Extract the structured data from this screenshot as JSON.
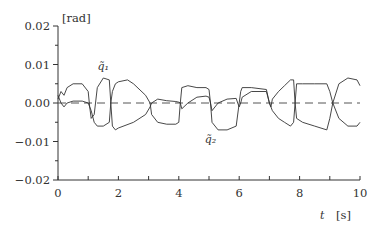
{
  "chart_data": {
    "type": "line",
    "title": "",
    "xlabel": "t",
    "xunit": "[s]",
    "ylabel": "",
    "yunit": "[rad]",
    "xlim": [
      0,
      10
    ],
    "ylim": [
      -0.02,
      0.02
    ],
    "xticks": [
      0,
      2,
      4,
      6,
      8,
      10
    ],
    "xtick_labels": [
      "0",
      "2",
      "4",
      "6",
      "8",
      "10"
    ],
    "xminor_ticks": [
      1,
      3,
      5,
      7,
      9
    ],
    "yticks": [
      -0.02,
      -0.01,
      0.0,
      0.01,
      0.02
    ],
    "ytick_labels": [
      "−0.02",
      "−0.01",
      "0.00",
      "0.01",
      "0.02"
    ],
    "yminor_ticks": [
      -0.015,
      -0.005,
      0.005,
      0.015
    ],
    "grid": false,
    "reference_line": {
      "y": 0.0,
      "style": "dashed"
    },
    "annotations": [
      {
        "text": "q̃₁",
        "label": "q1",
        "x": 1.5,
        "y": 0.0085
      },
      {
        "text": "q̃₂",
        "label": "q2",
        "x": 5.05,
        "y": -0.0103
      }
    ],
    "series": [
      {
        "name": "q1",
        "x": [
          0.0,
          0.1,
          0.2,
          0.3,
          0.5,
          0.8,
          1.0,
          1.05,
          1.1,
          1.2,
          1.3,
          1.5,
          1.7,
          1.75,
          1.8,
          1.9,
          2.0,
          2.5,
          2.9,
          3.05,
          3.1,
          3.3,
          3.6,
          3.9,
          4.0,
          4.05,
          4.1,
          4.3,
          4.6,
          4.9,
          5.0,
          5.05,
          5.1,
          5.3,
          5.6,
          5.9,
          5.95,
          6.0,
          6.05,
          6.1,
          6.4,
          6.9,
          7.0,
          7.05,
          7.1,
          7.3,
          7.5,
          7.7,
          7.8,
          7.85,
          7.9,
          8.1,
          8.5,
          8.9,
          9.0,
          9.1,
          9.3,
          9.6,
          9.9,
          10.0
        ],
        "values": [
          0.001,
          0.003,
          0.002,
          0.004,
          0.005,
          0.005,
          0.003,
          -0.001,
          -0.004,
          -0.003,
          0.004,
          0.0065,
          0.006,
          0.0,
          -0.006,
          -0.007,
          -0.0065,
          -0.005,
          -0.003,
          -0.001,
          0.0,
          0.001,
          0.0006,
          0.0004,
          0.0002,
          0.0,
          -0.0015,
          0.0,
          0.0015,
          0.0018,
          0.0015,
          0.0,
          -0.002,
          0.0,
          0.001,
          0.0012,
          0.0,
          -0.001,
          0.0,
          0.0015,
          0.003,
          0.003,
          0.0,
          -0.001,
          0.001,
          0.003,
          0.0045,
          0.006,
          0.006,
          0.0,
          -0.004,
          -0.005,
          -0.006,
          -0.007,
          -0.004,
          0.0,
          0.005,
          0.0065,
          0.006,
          0.0045
        ]
      },
      {
        "name": "q2",
        "x": [
          0.0,
          0.1,
          0.2,
          0.3,
          0.5,
          0.8,
          1.0,
          1.1,
          1.2,
          1.3,
          1.5,
          1.7,
          1.75,
          1.8,
          1.9,
          2.0,
          2.3,
          2.5,
          2.9,
          3.05,
          3.1,
          3.3,
          3.6,
          3.9,
          4.0,
          4.05,
          4.1,
          4.3,
          4.6,
          4.9,
          5.0,
          5.05,
          5.1,
          5.3,
          5.6,
          5.9,
          6.0,
          6.05,
          6.1,
          6.4,
          6.9,
          7.0,
          7.1,
          7.3,
          7.5,
          7.7,
          7.8,
          7.85,
          7.9,
          8.1,
          8.5,
          8.9,
          9.0,
          9.1,
          9.3,
          9.6,
          9.9,
          10.0
        ],
        "values": [
          0.002,
          0.0,
          -0.001,
          0.0,
          0.0005,
          0.0005,
          0.0,
          -0.002,
          -0.005,
          -0.006,
          -0.006,
          -0.005,
          0.0,
          0.003,
          0.005,
          0.0055,
          0.006,
          0.005,
          0.002,
          0.0,
          -0.003,
          -0.005,
          -0.0055,
          -0.0055,
          -0.005,
          0.0,
          0.004,
          0.0045,
          0.004,
          0.004,
          0.0035,
          0.0,
          -0.005,
          -0.007,
          -0.007,
          -0.006,
          0.0,
          0.003,
          0.004,
          0.004,
          0.0035,
          0.0,
          -0.002,
          -0.004,
          -0.005,
          -0.006,
          -0.005,
          0.0,
          0.005,
          0.005,
          0.005,
          0.005,
          0.003,
          0.0,
          -0.004,
          -0.006,
          -0.006,
          -0.005
        ]
      }
    ],
    "legend": "none (curves annotated inline)"
  }
}
